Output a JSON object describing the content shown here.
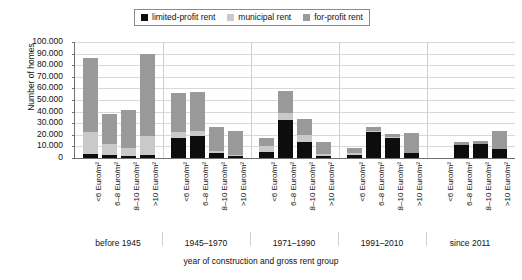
{
  "chart_data": {
    "type": "bar",
    "stacked": true,
    "title": "",
    "xlabel": "year of construction and gross rent group",
    "ylabel": "Number of homes",
    "ylim": [
      0,
      100000
    ],
    "ytick_step": 10000,
    "ytick_labels": [
      "100.000",
      "90.000",
      "80.000",
      "70.000",
      "60.000",
      "50.000",
      "40.000",
      "30.000",
      "20.000",
      "10.000",
      "0"
    ],
    "ytick_values": [
      100000,
      90000,
      80000,
      70000,
      60000,
      50000,
      40000,
      30000,
      20000,
      10000,
      0
    ],
    "grid": true,
    "legend_position": "top-center",
    "legend": [
      {
        "name": "limited-profit rent",
        "color": "#0d0d0d"
      },
      {
        "name": "municipal rent",
        "color": "#c9c9c9"
      },
      {
        "name": "for-profit rent",
        "color": "#9a9a9a"
      }
    ],
    "series": [
      {
        "name": "limited-profit rent",
        "color": "#0d0d0d",
        "values": [
          3500,
          3000,
          1500,
          3000,
          17000,
          19000,
          4000,
          2000,
          5000,
          33000,
          14000,
          1500,
          3000,
          22000,
          17000,
          4000,
          0,
          11000,
          12000,
          8000
        ]
      },
      {
        "name": "municipal rent",
        "color": "#c9c9c9",
        "values": [
          19000,
          9000,
          7000,
          16000,
          5000,
          4000,
          2000,
          1000,
          5000,
          6000,
          6000,
          2000,
          1000,
          1000,
          1000,
          0,
          0,
          0,
          0,
          0
        ]
      },
      {
        "name": "for-profit rent",
        "color": "#9a9a9a",
        "values": [
          63500,
          26000,
          32500,
          71000,
          34000,
          34000,
          21000,
          20000,
          7000,
          19000,
          14000,
          10000,
          5000,
          4000,
          3000,
          18000,
          0,
          3000,
          3000,
          15000
        ]
      }
    ],
    "groups": [
      {
        "label": "before 1945",
        "categories": [
          "<6 Euro/m²",
          "6–8 Euro/m²",
          "8–10 Euro/m²",
          ">10 Euro/m²"
        ]
      },
      {
        "label": "1945–1970",
        "categories": [
          "<6 Euro/m²",
          "6–8 Euro/m²",
          "8–10 Euro/m²",
          ">10 Euro/m²"
        ]
      },
      {
        "label": "1971–1990",
        "categories": [
          "<6 Euro/m²",
          "6–8 Euro/m²",
          "8–10 Euro/m²",
          ">10 Euro/m²"
        ]
      },
      {
        "label": "1991–2010",
        "categories": [
          "<6 Euro/m²",
          "6–8 Euro/m²",
          "8–10 Euro/m²",
          ">10 Euro/m²"
        ]
      },
      {
        "label": "since 2011",
        "categories": [
          "<6 Euro/m²",
          "6–8 Euro/m²",
          "8–10 Euro/m²",
          ">10 Euro/m²"
        ]
      }
    ]
  }
}
